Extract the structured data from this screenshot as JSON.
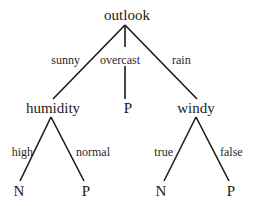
{
  "diagram": {
    "type": "decision-tree",
    "root": {
      "label": "outlook",
      "branches": [
        {
          "edge": "sunny",
          "node": {
            "label": "humidity",
            "branches": [
              {
                "edge": "high",
                "leaf": "N"
              },
              {
                "edge": "normal",
                "leaf": "P"
              }
            ]
          }
        },
        {
          "edge": "overcast",
          "leaf": "P"
        },
        {
          "edge": "rain",
          "node": {
            "label": "windy",
            "branches": [
              {
                "edge": "true",
                "leaf": "N"
              },
              {
                "edge": "false",
                "leaf": "P"
              }
            ]
          }
        }
      ]
    },
    "colors": {
      "line": "#1a1a1a",
      "text": "#1a1a1a",
      "background": "#ffffff"
    }
  }
}
